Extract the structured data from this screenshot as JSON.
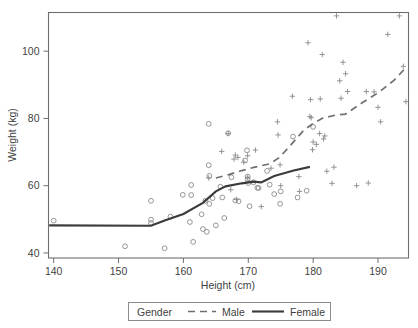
{
  "chart_data": {
    "type": "scatter",
    "title": "",
    "xlabel": "Height (cm)",
    "ylabel": "Weight (kg)",
    "xlim": [
      139.2,
      194.7
    ],
    "ylim": [
      38.5,
      111.5
    ],
    "xticks": [
      140,
      150,
      160,
      170,
      180,
      190
    ],
    "yticks": [
      40,
      60,
      80,
      100
    ],
    "xtick_labels": [
      "140",
      "150",
      "160",
      "170",
      "180",
      "190"
    ],
    "ytick_labels": [
      "40",
      "60",
      "80",
      "100"
    ],
    "grid": false,
    "legend": {
      "title": "Gender",
      "position": "bottom-outside",
      "entries": [
        {
          "label": "Male",
          "marker": "plus",
          "line_style": "dashed"
        },
        {
          "label": "Female",
          "marker": "circle",
          "line_style": "solid"
        }
      ]
    },
    "series": [
      {
        "name": "Female",
        "marker": "circle",
        "line_style": "solid",
        "points": [
          [
            140.0,
            49.6
          ],
          [
            151.0,
            42.0
          ],
          [
            155.0,
            55.5
          ],
          [
            155.0,
            49.9
          ],
          [
            155.0,
            48.9
          ],
          [
            157.1,
            41.4
          ],
          [
            158.0,
            50.8
          ],
          [
            159.9,
            57.3
          ],
          [
            161.0,
            49.2
          ],
          [
            161.2,
            57.2
          ],
          [
            161.2,
            60.2
          ],
          [
            161.5,
            43.3
          ],
          [
            162.8,
            51.5
          ],
          [
            163.0,
            47.1
          ],
          [
            163.4,
            55.5
          ],
          [
            163.6,
            46.3
          ],
          [
            163.9,
            78.4
          ],
          [
            163.9,
            66.1
          ],
          [
            164.0,
            62.9
          ],
          [
            164.0,
            54.6
          ],
          [
            164.5,
            56.3
          ],
          [
            165.0,
            48.2
          ],
          [
            165.7,
            59.7
          ],
          [
            166.0,
            56.5
          ],
          [
            166.3,
            50.4
          ],
          [
            166.9,
            75.6
          ],
          [
            167.4,
            62.5
          ],
          [
            168.0,
            55.6
          ],
          [
            168.5,
            55.4
          ],
          [
            169.5,
            67.5
          ],
          [
            169.8,
            70.5
          ],
          [
            169.9,
            62.7
          ],
          [
            169.9,
            61.9
          ],
          [
            170.0,
            60.8
          ],
          [
            170.2,
            53.9
          ],
          [
            170.8,
            61.0
          ],
          [
            171.4,
            59.4
          ],
          [
            171.6,
            59.3
          ],
          [
            172.9,
            64.4
          ],
          [
            173.3,
            60.3
          ],
          [
            174.0,
            57.5
          ],
          [
            174.9,
            54.6
          ],
          [
            175.0,
            58.3
          ],
          [
            176.9,
            74.6
          ],
          [
            177.6,
            56.5
          ],
          [
            179.0,
            58.5
          ],
          [
            180.0,
            77.5
          ]
        ],
        "trend": [
          [
            139.3,
            48.2
          ],
          [
            155.0,
            48.1
          ],
          [
            157.0,
            49.6
          ],
          [
            160.0,
            51.6
          ],
          [
            163.0,
            54.9
          ],
          [
            165.0,
            58.3
          ],
          [
            166.5,
            59.8
          ],
          [
            169.0,
            60.7
          ],
          [
            170.8,
            61.2
          ],
          [
            172.0,
            61.0
          ],
          [
            174.0,
            62.9
          ],
          [
            177.0,
            64.5
          ],
          [
            179.5,
            65.6
          ]
        ]
      },
      {
        "name": "Male",
        "marker": "plus",
        "line_style": "dashed",
        "points": [
          [
            163.9,
            62.3
          ],
          [
            165.9,
            70.2
          ],
          [
            166.9,
            75.5
          ],
          [
            167.3,
            58.8
          ],
          [
            167.8,
            67.9
          ],
          [
            168.0,
            69.1
          ],
          [
            168.2,
            55.9
          ],
          [
            168.4,
            68.4
          ],
          [
            169.3,
            67.0
          ],
          [
            169.9,
            68.9
          ],
          [
            169.9,
            62.5
          ],
          [
            171.1,
            70.6
          ],
          [
            172.0,
            53.8
          ],
          [
            173.5,
            65.2
          ],
          [
            174.5,
            79.0
          ],
          [
            174.6,
            75.1
          ],
          [
            174.9,
            66.2
          ],
          [
            175.0,
            60.0
          ],
          [
            176.8,
            86.6
          ],
          [
            177.8,
            62.7
          ],
          [
            177.9,
            58.3
          ],
          [
            179.2,
            102.5
          ],
          [
            179.5,
            80.6
          ],
          [
            179.6,
            85.6
          ],
          [
            179.7,
            80.2
          ],
          [
            179.9,
            70.7
          ],
          [
            180.0,
            73.0
          ],
          [
            180.5,
            72.3
          ],
          [
            181.0,
            75.5
          ],
          [
            181.1,
            85.8
          ],
          [
            181.4,
            99.0
          ],
          [
            181.6,
            73.9
          ],
          [
            181.8,
            74.8
          ],
          [
            182.1,
            64.3
          ],
          [
            182.9,
            60.7
          ],
          [
            183.2,
            65.5
          ],
          [
            183.6,
            110.5
          ],
          [
            184.1,
            91.2
          ],
          [
            184.3,
            86.0
          ],
          [
            184.6,
            96.7
          ],
          [
            185.0,
            93.3
          ],
          [
            185.3,
            88.0
          ],
          [
            186.7,
            60.0
          ],
          [
            188.2,
            88.0
          ],
          [
            188.5,
            60.8
          ],
          [
            189.4,
            87.9
          ],
          [
            190.0,
            83.3
          ],
          [
            190.4,
            79.0
          ],
          [
            191.5,
            105.0
          ],
          [
            193.3,
            110.5
          ],
          [
            193.9,
            95.5
          ],
          [
            194.3,
            85.0
          ]
        ],
        "trend": [
          [
            165.0,
            62.3
          ],
          [
            167.0,
            63.3
          ],
          [
            169.0,
            64.5
          ],
          [
            171.0,
            65.5
          ],
          [
            173.3,
            66.5
          ],
          [
            174.8,
            68.4
          ],
          [
            176.5,
            72.0
          ],
          [
            178.6,
            76.6
          ],
          [
            180.0,
            78.5
          ],
          [
            181.5,
            80.1
          ],
          [
            183.5,
            81.0
          ],
          [
            185.0,
            81.3
          ],
          [
            187.5,
            84.6
          ],
          [
            190.0,
            87.6
          ],
          [
            192.5,
            91.4
          ],
          [
            194.4,
            95.3
          ]
        ]
      }
    ]
  }
}
